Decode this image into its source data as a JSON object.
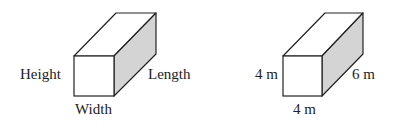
{
  "diagram": {
    "colors": {
      "stroke": "#222222",
      "front_face": "#ffffff",
      "top_face": "#ffffff",
      "side_face": "#d4d4d4",
      "text": "#222222"
    },
    "figures": [
      {
        "name": "generic-box",
        "labels": {
          "height": "Height",
          "length": "Length",
          "width": "Width"
        }
      },
      {
        "name": "example-box",
        "labels": {
          "height": "4 m",
          "length": "6 m",
          "width": "4 m"
        }
      }
    ]
  }
}
